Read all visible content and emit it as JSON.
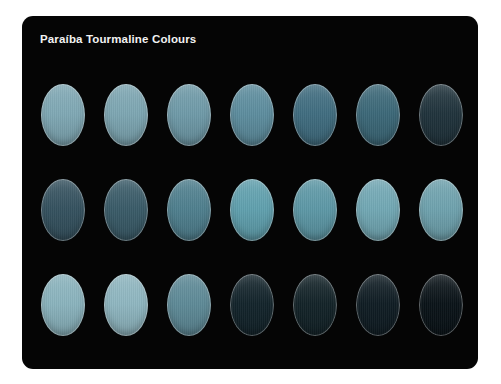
{
  "card": {
    "title": "Paraíba Tourmaline Colours",
    "background_color": "#050505",
    "title_color": "#f2f2f2",
    "page_background": "#ffffff",
    "corner_radius_px": 11
  },
  "chart_data": {
    "type": "table",
    "title": "Paraíba Tourmaline Colours",
    "subtitle": "",
    "xlabel": "",
    "ylabel": "",
    "layout": {
      "columns": 7,
      "rows": 3,
      "swatch_shape": "oval",
      "swatch_width_px": 44,
      "swatch_height_px": 62,
      "column_pitch_px": 63,
      "row_pitch_px": 95,
      "grid": "off",
      "legend": "none"
    },
    "row_labels": [
      "Row 1",
      "Row 2",
      "Row 3"
    ],
    "column_labels": [
      "1",
      "2",
      "3",
      "4",
      "5",
      "6",
      "7"
    ],
    "series": [
      {
        "name": "Row 1",
        "values": [
          "#7fa8b4",
          "#7da6b2",
          "#6f9aa8",
          "#5d8d9e",
          "#406d80",
          "#3c6878",
          "#20333c"
        ]
      },
      {
        "name": "Row 2",
        "values": [
          "#35525f",
          "#3a5b68",
          "#4f7f8e",
          "#60a0ae",
          "#5d98a6",
          "#72a8b4",
          "#6fa2ae"
        ]
      },
      {
        "name": "Row 3",
        "values": [
          "#8ab3bd",
          "#8fb6c0",
          "#5e8a97",
          "#13242b",
          "#132328",
          "#101d24",
          "#0a1318"
        ]
      }
    ],
    "swatches": [
      {
        "row": 1,
        "column": 1,
        "color": "#7fa8b4"
      },
      {
        "row": 1,
        "column": 2,
        "color": "#7da6b2"
      },
      {
        "row": 1,
        "column": 3,
        "color": "#6f9aa8"
      },
      {
        "row": 1,
        "column": 4,
        "color": "#5d8d9e"
      },
      {
        "row": 1,
        "column": 5,
        "color": "#406d80"
      },
      {
        "row": 1,
        "column": 6,
        "color": "#3c6878"
      },
      {
        "row": 1,
        "column": 7,
        "color": "#20333c"
      },
      {
        "row": 2,
        "column": 1,
        "color": "#35525f"
      },
      {
        "row": 2,
        "column": 2,
        "color": "#3a5b68"
      },
      {
        "row": 2,
        "column": 3,
        "color": "#4f7f8e"
      },
      {
        "row": 2,
        "column": 4,
        "color": "#60a0ae"
      },
      {
        "row": 2,
        "column": 5,
        "color": "#5d98a6"
      },
      {
        "row": 2,
        "column": 6,
        "color": "#72a8b4"
      },
      {
        "row": 2,
        "column": 7,
        "color": "#6fa2ae"
      },
      {
        "row": 3,
        "column": 1,
        "color": "#8ab3bd"
      },
      {
        "row": 3,
        "column": 2,
        "color": "#8fb6c0"
      },
      {
        "row": 3,
        "column": 3,
        "color": "#5e8a97"
      },
      {
        "row": 3,
        "column": 4,
        "color": "#13242b"
      },
      {
        "row": 3,
        "column": 5,
        "color": "#132328"
      },
      {
        "row": 3,
        "column": 6,
        "color": "#101d24"
      },
      {
        "row": 3,
        "column": 7,
        "color": "#0a1318"
      }
    ]
  }
}
